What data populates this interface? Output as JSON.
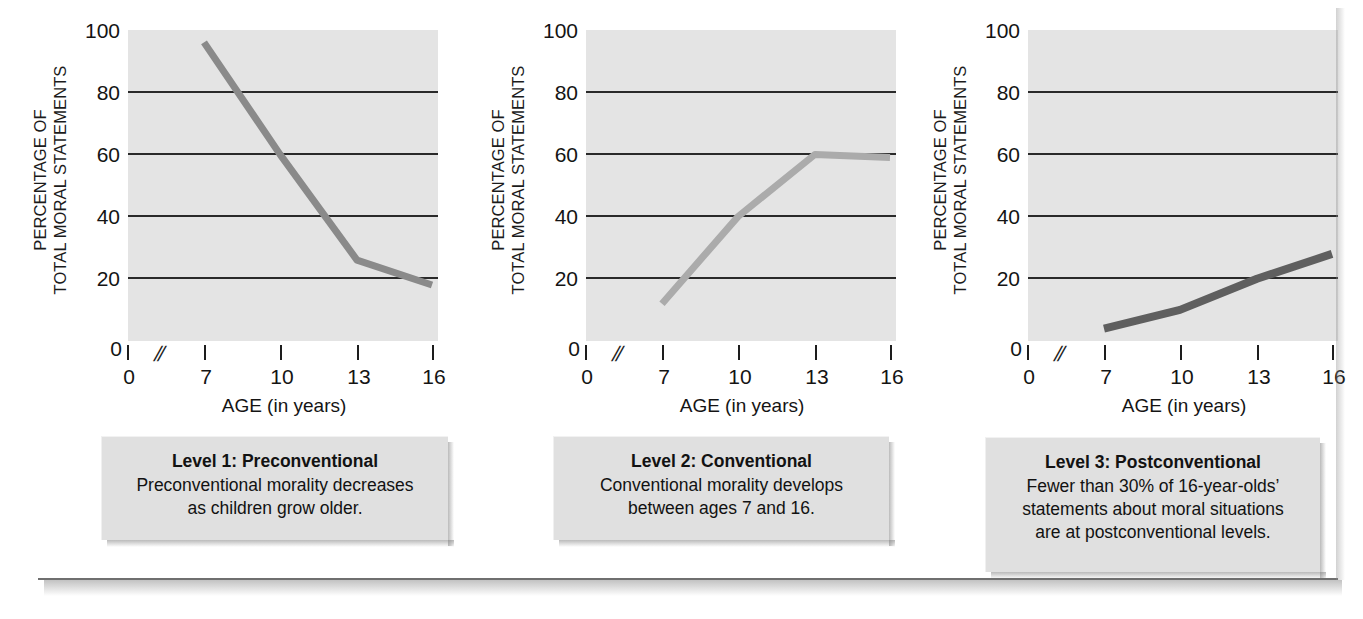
{
  "figure": {
    "axis_title_y": "PERCENTAGE OF\nTOTAL MORAL STATEMENTS",
    "axis_title_x": "AGE (in years)",
    "y_tick_labels": [
      "100",
      "80",
      "60",
      "40",
      "20"
    ],
    "y_zero_label": "0",
    "x_tick_labels": [
      "0",
      "7",
      "10",
      "13",
      "16"
    ],
    "axis_break_glyph": "//",
    "colors": {
      "plot_background": "#e4e4e4",
      "gridline": "#2a2a2a",
      "caption_background": "#e0e0e0",
      "series_level1": "#8a8a8a",
      "series_level2": "#ababab",
      "series_level3": "#5f5f5f",
      "text": "#141414"
    }
  },
  "panels": [
    {
      "id": "level-1",
      "caption_title": "Level 1: Preconventional",
      "caption_body": "Preconventional morality decreases\nas children grow older.",
      "chart_data": {
        "type": "line",
        "title": "Level 1: Preconventional",
        "xlabel": "AGE (in years)",
        "ylabel": "PERCENTAGE OF TOTAL MORAL STATEMENTS",
        "xlim": [
          0,
          16
        ],
        "ylim": [
          0,
          100
        ],
        "xticks": [
          0,
          7,
          10,
          13,
          16
        ],
        "yticks": [
          0,
          20,
          40,
          60,
          80,
          100
        ],
        "grid": "horizontal",
        "axis_break": true,
        "legend": "none",
        "series": [
          {
            "name": "Preconventional",
            "color": "#8a8a8a",
            "x": [
              7,
              10,
              13,
              16
            ],
            "values": [
              96,
              60,
              26,
              18
            ]
          }
        ]
      }
    },
    {
      "id": "level-2",
      "caption_title": "Level 2: Conventional",
      "caption_body": "Conventional morality develops\nbetween ages 7 and 16.",
      "chart_data": {
        "type": "line",
        "title": "Level 2: Conventional",
        "xlabel": "AGE (in years)",
        "ylabel": "PERCENTAGE OF TOTAL MORAL STATEMENTS",
        "xlim": [
          0,
          16
        ],
        "ylim": [
          0,
          100
        ],
        "xticks": [
          0,
          7,
          10,
          13,
          16
        ],
        "yticks": [
          0,
          20,
          40,
          60,
          80,
          100
        ],
        "grid": "horizontal",
        "axis_break": true,
        "legend": "none",
        "series": [
          {
            "name": "Conventional",
            "color": "#ababab",
            "x": [
              7,
              10,
              13,
              16
            ],
            "values": [
              12,
              40,
              60,
              59
            ]
          }
        ]
      }
    },
    {
      "id": "level-3",
      "caption_title": "Level 3: Postconventional",
      "caption_body": "Fewer than 30% of 16-year-olds’\nstatements about moral situations\nare at postconventional levels.",
      "chart_data": {
        "type": "line",
        "title": "Level 3: Postconventional",
        "xlabel": "AGE (in years)",
        "ylabel": "PERCENTAGE OF TOTAL MORAL STATEMENTS",
        "xlim": [
          0,
          16
        ],
        "ylim": [
          0,
          100
        ],
        "xticks": [
          0,
          7,
          10,
          13,
          16
        ],
        "yticks": [
          0,
          20,
          40,
          60,
          80,
          100
        ],
        "grid": "horizontal",
        "axis_break": true,
        "legend": "none",
        "series": [
          {
            "name": "Postconventional",
            "color": "#5f5f5f",
            "x": [
              7,
              10,
              13,
              16
            ],
            "values": [
              4,
              10,
              20,
              28
            ]
          }
        ]
      }
    }
  ]
}
